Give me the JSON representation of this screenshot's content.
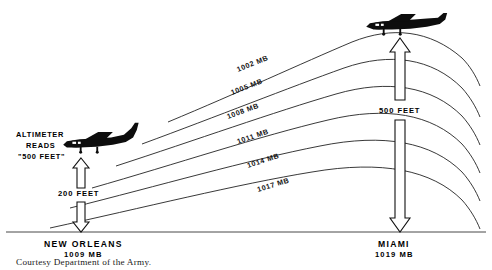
{
  "figure": {
    "background_color": "#ffffff",
    "ink_color": "#111111"
  },
  "isobars": [
    {
      "label": "1002 MB",
      "value": 1002,
      "unit": "MB"
    },
    {
      "label": "1005 MB",
      "value": 1005,
      "unit": "MB"
    },
    {
      "label": "1008 MB",
      "value": 1008,
      "unit": "MB"
    },
    {
      "label": "1011 MB",
      "value": 1011,
      "unit": "MB"
    },
    {
      "label": "1014 MB",
      "value": 1014,
      "unit": "MB"
    },
    {
      "label": "1017 MB",
      "value": 1017,
      "unit": "MB"
    }
  ],
  "left_station": {
    "name": "NEW ORLEANS",
    "pressure": "1009 MB",
    "callout_line1": "ALTIMETER",
    "callout_line2": "READS",
    "callout_line3": "\"500 FEET\"",
    "measure_label": "200 FEET",
    "aircraft_name": "airplane-icon"
  },
  "right_station": {
    "name": "MIAMI",
    "pressure": "1019 MB",
    "measure_label": "500 FEET",
    "aircraft_name": "airplane-icon"
  },
  "credit": {
    "text": "Courtesy Department of the Army."
  }
}
